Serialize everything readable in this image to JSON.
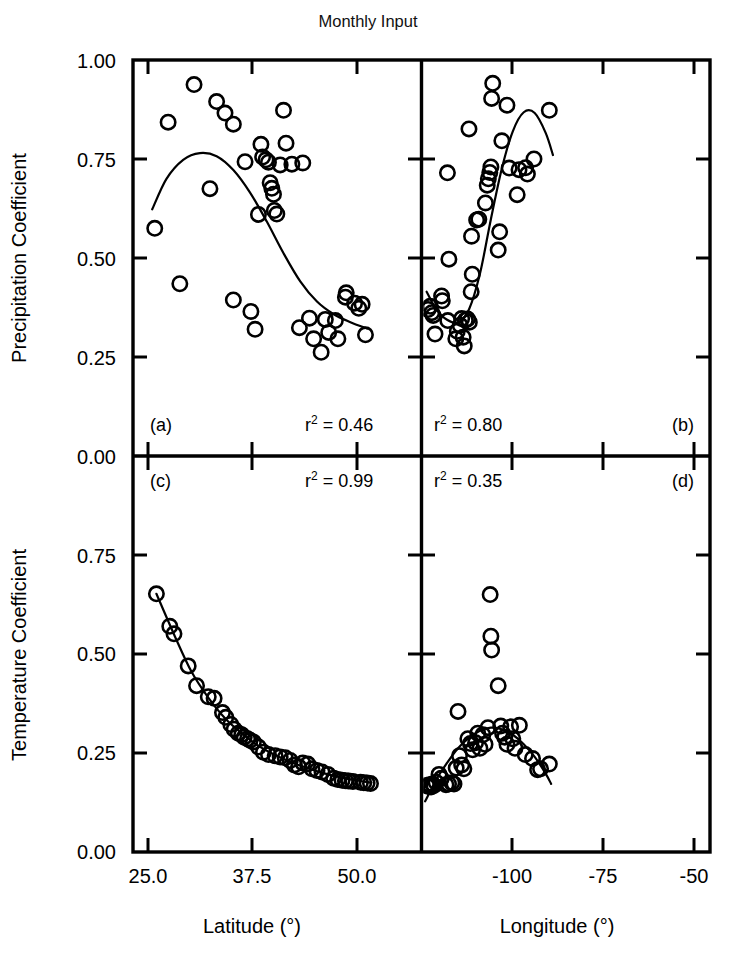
{
  "figure": {
    "title": "Monthly Input",
    "background": "#ffffff",
    "ink": "#000000"
  },
  "axes": {
    "left_top_title": "Precipitation Coefficient",
    "left_bottom_title": "Temperature Coefficient",
    "bottom_left_title": "Latitude (°)",
    "bottom_right_title": "Longitude (°)",
    "y_top_ticks": [
      "1.00",
      "0.75",
      "0.50",
      "0.25",
      "0.00"
    ],
    "y_bottom_ticks": [
      "0.00",
      "0.75",
      "0.50",
      "0.25",
      "0.00"
    ],
    "x_left_ticks": [
      "25.0",
      "37.5",
      "50.0"
    ],
    "x_right_ticks": [
      "-100",
      "-75",
      "-50"
    ]
  },
  "chart_data": {
    "type": "scatter",
    "title": "Monthly Input",
    "layout": "2x2 panel grid, shared axes, no gridlines, no legend",
    "grid": false,
    "legend": false,
    "panels": [
      {
        "id": "a",
        "label": "(a)",
        "annotation": "r2 = 0.46",
        "r_squared": 0.46,
        "xlabel": "Latitude (°)",
        "ylabel": "Precipitation Coefficient",
        "xlim": [
          23.0,
          57.5
        ],
        "ylim": [
          0.0,
          1.0
        ],
        "xticks": [
          25.0,
          37.5,
          50.0
        ],
        "yticks": [
          0.0,
          0.25,
          0.5,
          0.75,
          1.0
        ],
        "fit_type": "cubic polynomial",
        "points": [
          {
            "x": 25.6,
            "y": 0.575
          },
          {
            "x": 27.2,
            "y": 0.843
          },
          {
            "x": 28.6,
            "y": 0.435
          },
          {
            "x": 30.3,
            "y": 0.938
          },
          {
            "x": 32.2,
            "y": 0.675
          },
          {
            "x": 33.0,
            "y": 0.895
          },
          {
            "x": 34.0,
            "y": 0.866
          },
          {
            "x": 35.0,
            "y": 0.838
          },
          {
            "x": 35.0,
            "y": 0.394
          },
          {
            "x": 36.4,
            "y": 0.743
          },
          {
            "x": 37.1,
            "y": 0.365
          },
          {
            "x": 38.3,
            "y": 0.787
          },
          {
            "x": 38.5,
            "y": 0.755
          },
          {
            "x": 38.9,
            "y": 0.748
          },
          {
            "x": 39.2,
            "y": 0.742
          },
          {
            "x": 39.4,
            "y": 0.69
          },
          {
            "x": 39.6,
            "y": 0.676
          },
          {
            "x": 39.8,
            "y": 0.661
          },
          {
            "x": 39.9,
            "y": 0.62
          },
          {
            "x": 40.2,
            "y": 0.611
          },
          {
            "x": 38.0,
            "y": 0.61
          },
          {
            "x": 37.6,
            "y": 0.32
          },
          {
            "x": 40.6,
            "y": 0.735
          },
          {
            "x": 41.0,
            "y": 0.873
          },
          {
            "x": 41.3,
            "y": 0.79
          },
          {
            "x": 42.0,
            "y": 0.737
          },
          {
            "x": 43.3,
            "y": 0.74
          },
          {
            "x": 42.9,
            "y": 0.324
          },
          {
            "x": 44.1,
            "y": 0.348
          },
          {
            "x": 44.6,
            "y": 0.296
          },
          {
            "x": 45.5,
            "y": 0.262
          },
          {
            "x": 46.0,
            "y": 0.345
          },
          {
            "x": 46.4,
            "y": 0.312
          },
          {
            "x": 47.2,
            "y": 0.342
          },
          {
            "x": 47.5,
            "y": 0.296
          },
          {
            "x": 48.4,
            "y": 0.401
          },
          {
            "x": 48.5,
            "y": 0.412
          },
          {
            "x": 49.5,
            "y": 0.386
          },
          {
            "x": 50.0,
            "y": 0.373
          },
          {
            "x": 50.4,
            "y": 0.383
          },
          {
            "x": 50.8,
            "y": 0.306
          }
        ],
        "fit_curve": [
          {
            "x": 25.3,
            "y": 0.623
          },
          {
            "x": 27.0,
            "y": 0.7
          },
          {
            "x": 29.0,
            "y": 0.748
          },
          {
            "x": 31.0,
            "y": 0.765
          },
          {
            "x": 33.0,
            "y": 0.757
          },
          {
            "x": 35.0,
            "y": 0.722
          },
          {
            "x": 37.0,
            "y": 0.665
          },
          {
            "x": 39.0,
            "y": 0.592
          },
          {
            "x": 41.0,
            "y": 0.512
          },
          {
            "x": 43.0,
            "y": 0.441
          },
          {
            "x": 45.0,
            "y": 0.39
          },
          {
            "x": 47.0,
            "y": 0.358
          },
          {
            "x": 49.0,
            "y": 0.338
          },
          {
            "x": 51.0,
            "y": 0.322
          }
        ]
      },
      {
        "id": "b",
        "label": "(b)",
        "annotation": "r2 = 0.80",
        "r_squared": 0.8,
        "xlabel": "Longitude (°)",
        "ylabel": "Precipitation Coefficient",
        "xlim": [
          -126.0,
          -47.0
        ],
        "ylim": [
          0.0,
          1.0
        ],
        "xticks": [
          -100,
          -75,
          -50
        ],
        "yticks": [
          0.0,
          0.25,
          0.5,
          0.75,
          1.0
        ],
        "fit_type": "cubic polynomial",
        "points": [
          {
            "x": -124.2,
            "y": 0.37
          },
          {
            "x": -123.6,
            "y": 0.378
          },
          {
            "x": -123.2,
            "y": 0.362
          },
          {
            "x": -122.8,
            "y": 0.355
          },
          {
            "x": -122.3,
            "y": 0.308
          },
          {
            "x": -120.5,
            "y": 0.404
          },
          {
            "x": -120.3,
            "y": 0.392
          },
          {
            "x": -118.8,
            "y": 0.342
          },
          {
            "x": -116.6,
            "y": 0.296
          },
          {
            "x": -116.2,
            "y": 0.315
          },
          {
            "x": -115.4,
            "y": 0.33
          },
          {
            "x": -115.0,
            "y": 0.347
          },
          {
            "x": -114.6,
            "y": 0.3
          },
          {
            "x": -114.3,
            "y": 0.278
          },
          {
            "x": -114.0,
            "y": 0.343
          },
          {
            "x": -113.4,
            "y": 0.346
          },
          {
            "x": -112.9,
            "y": 0.338
          },
          {
            "x": -112.4,
            "y": 0.415
          },
          {
            "x": -112.1,
            "y": 0.459
          },
          {
            "x": -118.5,
            "y": 0.497
          },
          {
            "x": -112.3,
            "y": 0.555
          },
          {
            "x": -110.9,
            "y": 0.596
          },
          {
            "x": -110.3,
            "y": 0.598
          },
          {
            "x": -108.5,
            "y": 0.639
          },
          {
            "x": -108.0,
            "y": 0.684
          },
          {
            "x": -107.7,
            "y": 0.7
          },
          {
            "x": -107.3,
            "y": 0.716
          },
          {
            "x": -107.0,
            "y": 0.73
          },
          {
            "x": -118.9,
            "y": 0.715
          },
          {
            "x": -113.0,
            "y": 0.826
          },
          {
            "x": -106.8,
            "y": 0.903
          },
          {
            "x": -106.5,
            "y": 0.941
          },
          {
            "x": -105.0,
            "y": 0.52
          },
          {
            "x": -104.6,
            "y": 0.566
          },
          {
            "x": -104.0,
            "y": 0.796
          },
          {
            "x": -102.6,
            "y": 0.886
          },
          {
            "x": -102.0,
            "y": 0.727
          },
          {
            "x": -99.8,
            "y": 0.66
          },
          {
            "x": -99.3,
            "y": 0.723
          },
          {
            "x": -97.5,
            "y": 0.728
          },
          {
            "x": -97.0,
            "y": 0.712
          },
          {
            "x": -95.2,
            "y": 0.75
          },
          {
            "x": -91.0,
            "y": 0.873
          }
        ],
        "fit_curve": [
          {
            "x": -124.6,
            "y": 0.415
          },
          {
            "x": -122.0,
            "y": 0.371
          },
          {
            "x": -119.0,
            "y": 0.344
          },
          {
            "x": -116.0,
            "y": 0.337
          },
          {
            "x": -113.0,
            "y": 0.37
          },
          {
            "x": -110.0,
            "y": 0.46
          },
          {
            "x": -107.0,
            "y": 0.598
          },
          {
            "x": -104.0,
            "y": 0.726
          },
          {
            "x": -101.0,
            "y": 0.82
          },
          {
            "x": -98.0,
            "y": 0.868
          },
          {
            "x": -95.0,
            "y": 0.866
          },
          {
            "x": -92.0,
            "y": 0.816
          },
          {
            "x": -90.0,
            "y": 0.76
          }
        ]
      },
      {
        "id": "c",
        "label": "(c)",
        "annotation": "r2 = 0.99",
        "r_squared": 0.99,
        "xlabel": "Latitude (°)",
        "ylabel": "Temperature Coefficient",
        "xlim": [
          23.0,
          57.5
        ],
        "ylim": [
          0.0,
          1.0
        ],
        "xticks": [
          25.0,
          37.5,
          50.0
        ],
        "yticks": [
          0.0,
          0.25,
          0.5,
          0.75,
          1.0
        ],
        "fit_type": "exponential decay",
        "points": [
          {
            "x": 25.8,
            "y": 0.652
          },
          {
            "x": 27.4,
            "y": 0.57
          },
          {
            "x": 27.9,
            "y": 0.551
          },
          {
            "x": 29.6,
            "y": 0.47
          },
          {
            "x": 30.6,
            "y": 0.42
          },
          {
            "x": 32.0,
            "y": 0.392
          },
          {
            "x": 32.7,
            "y": 0.388
          },
          {
            "x": 33.7,
            "y": 0.352
          },
          {
            "x": 34.1,
            "y": 0.34
          },
          {
            "x": 34.7,
            "y": 0.322
          },
          {
            "x": 35.1,
            "y": 0.31
          },
          {
            "x": 35.6,
            "y": 0.3
          },
          {
            "x": 36.0,
            "y": 0.296
          },
          {
            "x": 36.3,
            "y": 0.29
          },
          {
            "x": 36.7,
            "y": 0.286
          },
          {
            "x": 37.0,
            "y": 0.282
          },
          {
            "x": 37.4,
            "y": 0.278
          },
          {
            "x": 38.0,
            "y": 0.265
          },
          {
            "x": 38.6,
            "y": 0.252
          },
          {
            "x": 39.2,
            "y": 0.246
          },
          {
            "x": 40.0,
            "y": 0.243
          },
          {
            "x": 40.6,
            "y": 0.24
          },
          {
            "x": 41.2,
            "y": 0.238
          },
          {
            "x": 41.8,
            "y": 0.231
          },
          {
            "x": 42.3,
            "y": 0.22
          },
          {
            "x": 42.8,
            "y": 0.215
          },
          {
            "x": 43.3,
            "y": 0.225
          },
          {
            "x": 43.9,
            "y": 0.222
          },
          {
            "x": 44.4,
            "y": 0.21
          },
          {
            "x": 45.0,
            "y": 0.206
          },
          {
            "x": 45.6,
            "y": 0.202
          },
          {
            "x": 46.3,
            "y": 0.196
          },
          {
            "x": 47.0,
            "y": 0.186
          },
          {
            "x": 47.5,
            "y": 0.183
          },
          {
            "x": 48.0,
            "y": 0.181
          },
          {
            "x": 48.4,
            "y": 0.18
          },
          {
            "x": 48.8,
            "y": 0.179
          },
          {
            "x": 49.3,
            "y": 0.178
          },
          {
            "x": 50.2,
            "y": 0.176
          },
          {
            "x": 50.6,
            "y": 0.175
          },
          {
            "x": 51.0,
            "y": 0.174
          },
          {
            "x": 51.4,
            "y": 0.173
          }
        ],
        "fit_curve": [
          {
            "x": 25.8,
            "y": 0.652
          },
          {
            "x": 28.0,
            "y": 0.545
          },
          {
            "x": 30.0,
            "y": 0.455
          },
          {
            "x": 32.0,
            "y": 0.39
          },
          {
            "x": 34.0,
            "y": 0.338
          },
          {
            "x": 36.0,
            "y": 0.3
          },
          {
            "x": 38.0,
            "y": 0.268
          },
          {
            "x": 40.0,
            "y": 0.245
          },
          {
            "x": 42.0,
            "y": 0.226
          },
          {
            "x": 44.0,
            "y": 0.211
          },
          {
            "x": 46.0,
            "y": 0.198
          },
          {
            "x": 48.0,
            "y": 0.188
          },
          {
            "x": 50.0,
            "y": 0.18
          },
          {
            "x": 51.5,
            "y": 0.175
          }
        ]
      },
      {
        "id": "d",
        "label": "(d)",
        "annotation": "r2 = 0.35",
        "r_squared": 0.35,
        "xlabel": "Longitude (°)",
        "ylabel": "Temperature Coefficient",
        "xlim": [
          -126.0,
          -47.0
        ],
        "ylim": [
          0.0,
          1.0
        ],
        "xticks": [
          -100,
          -75,
          -50
        ],
        "yticks": [
          0.0,
          0.25,
          0.5,
          0.75,
          1.0
        ],
        "fit_type": "quadratic polynomial",
        "points": [
          {
            "x": -124.6,
            "y": 0.168
          },
          {
            "x": -124.2,
            "y": 0.166
          },
          {
            "x": -123.8,
            "y": 0.17
          },
          {
            "x": -123.4,
            "y": 0.164
          },
          {
            "x": -123.0,
            "y": 0.172
          },
          {
            "x": -122.6,
            "y": 0.168
          },
          {
            "x": -122.0,
            "y": 0.176
          },
          {
            "x": -121.2,
            "y": 0.196
          },
          {
            "x": -120.6,
            "y": 0.186
          },
          {
            "x": -119.3,
            "y": 0.17
          },
          {
            "x": -118.6,
            "y": 0.172
          },
          {
            "x": -117.7,
            "y": 0.175
          },
          {
            "x": -117.1,
            "y": 0.172
          },
          {
            "x": -116.5,
            "y": 0.212
          },
          {
            "x": -115.6,
            "y": 0.243
          },
          {
            "x": -115.0,
            "y": 0.22
          },
          {
            "x": -114.4,
            "y": 0.21
          },
          {
            "x": -116.0,
            "y": 0.355
          },
          {
            "x": -113.3,
            "y": 0.286
          },
          {
            "x": -112.6,
            "y": 0.274
          },
          {
            "x": -112.0,
            "y": 0.258
          },
          {
            "x": -111.2,
            "y": 0.276
          },
          {
            "x": -110.6,
            "y": 0.3
          },
          {
            "x": -110.0,
            "y": 0.262
          },
          {
            "x": -109.2,
            "y": 0.296
          },
          {
            "x": -108.6,
            "y": 0.272
          },
          {
            "x": -107.8,
            "y": 0.314
          },
          {
            "x": -107.2,
            "y": 0.65
          },
          {
            "x": -107.0,
            "y": 0.545
          },
          {
            "x": -106.8,
            "y": 0.51
          },
          {
            "x": -105.0,
            "y": 0.42
          },
          {
            "x": -104.3,
            "y": 0.318
          },
          {
            "x": -103.8,
            "y": 0.3
          },
          {
            "x": -103.2,
            "y": 0.29
          },
          {
            "x": -102.6,
            "y": 0.272
          },
          {
            "x": -101.6,
            "y": 0.316
          },
          {
            "x": -101.0,
            "y": 0.286
          },
          {
            "x": -100.4,
            "y": 0.262
          },
          {
            "x": -99.2,
            "y": 0.32
          },
          {
            "x": -97.6,
            "y": 0.246
          },
          {
            "x": -95.6,
            "y": 0.236
          },
          {
            "x": -94.2,
            "y": 0.208
          },
          {
            "x": -93.4,
            "y": 0.21
          },
          {
            "x": -91.0,
            "y": 0.222
          }
        ],
        "fit_curve": [
          {
            "x": -125.0,
            "y": 0.128
          },
          {
            "x": -122.0,
            "y": 0.182
          },
          {
            "x": -119.0,
            "y": 0.225
          },
          {
            "x": -116.0,
            "y": 0.262
          },
          {
            "x": -113.0,
            "y": 0.288
          },
          {
            "x": -110.0,
            "y": 0.306
          },
          {
            "x": -107.0,
            "y": 0.314
          },
          {
            "x": -104.0,
            "y": 0.31
          },
          {
            "x": -101.0,
            "y": 0.296
          },
          {
            "x": -98.0,
            "y": 0.272
          },
          {
            "x": -95.0,
            "y": 0.24
          },
          {
            "x": -92.0,
            "y": 0.198
          },
          {
            "x": -90.5,
            "y": 0.172
          }
        ]
      }
    ]
  }
}
